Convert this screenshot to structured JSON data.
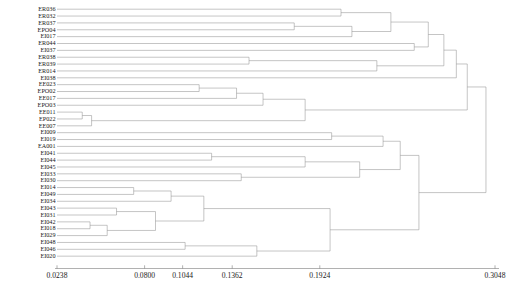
{
  "figure": {
    "type": "dendrogram",
    "orientation": "horizontal",
    "leaf_count": 36
  },
  "leaves": [
    {
      "label": "ER036"
    },
    {
      "label": "ER032"
    },
    {
      "label": "ER037"
    },
    {
      "label": "EPO04"
    },
    {
      "label": "EI017"
    },
    {
      "label": "ER044"
    },
    {
      "label": "EI037"
    },
    {
      "label": "ER038"
    },
    {
      "label": "ER039"
    },
    {
      "label": "ER014"
    },
    {
      "label": "EI038"
    },
    {
      "label": "EE023"
    },
    {
      "label": "EPO02"
    },
    {
      "label": "EE017"
    },
    {
      "label": "EPO03"
    },
    {
      "label": "EE011"
    },
    {
      "label": "EP022"
    },
    {
      "label": "EE007"
    },
    {
      "label": "EI009"
    },
    {
      "label": "EI019"
    },
    {
      "label": "EA001"
    },
    {
      "label": "EI041"
    },
    {
      "label": "EI044"
    },
    {
      "label": "EI045"
    },
    {
      "label": "EI033"
    },
    {
      "label": "EI030"
    },
    {
      "label": "EI014"
    },
    {
      "label": "EI049"
    },
    {
      "label": "EI034"
    },
    {
      "label": "EI043"
    },
    {
      "label": "EI031"
    },
    {
      "label": "EI042"
    },
    {
      "label": "EI018"
    },
    {
      "label": "EI029"
    },
    {
      "label": "EI048"
    },
    {
      "label": "EI046"
    },
    {
      "label": "EI020"
    }
  ],
  "axis": {
    "ticks": [
      {
        "value": 0.0238,
        "label": "0.0238"
      },
      {
        "value": 0.08,
        "label": "0.0800"
      },
      {
        "value": 0.1044,
        "label": "0.1044"
      },
      {
        "value": 0.1362,
        "label": "0.1362"
      },
      {
        "value": 0.1924,
        "label": "0.1924"
      },
      {
        "value": 0.3048,
        "label": "0.3048"
      }
    ],
    "min": 0.0238,
    "max": 0.3048
  },
  "chart_data": {
    "type": "dendrogram",
    "title": "",
    "xlabel": "",
    "ylabel": "",
    "xlim": [
      0.0238,
      0.3048
    ],
    "grid": false,
    "legend": "none",
    "leaf_order": [
      "ER036",
      "ER032",
      "ER037",
      "EPO04",
      "EI017",
      "ER044",
      "EI037",
      "ER038",
      "ER039",
      "ER014",
      "EI038",
      "EE023",
      "EPO02",
      "EE017",
      "EPO03",
      "EE011",
      "EP022",
      "EE007",
      "EI009",
      "EI019",
      "EA001",
      "EI041",
      "EI044",
      "EI045",
      "EI033",
      "EI030",
      "EI014",
      "EI049",
      "EI034",
      "EI043",
      "EI031",
      "EI042",
      "EI018",
      "EI029",
      "EI048",
      "EI046",
      "EI020"
    ],
    "merges": [
      {
        "id": "m1",
        "left": {
          "leaf": 11
        },
        "right": {
          "leaf": 12
        },
        "height": 0.115
      },
      {
        "id": "m2",
        "left": {
          "node": "m1"
        },
        "right": {
          "leaf": 13
        },
        "height": 0.139
      },
      {
        "id": "m3",
        "left": {
          "node": "m2"
        },
        "right": {
          "leaf": 14
        },
        "height": 0.156
      },
      {
        "id": "m4",
        "left": {
          "leaf": 15
        },
        "right": {
          "leaf": 16
        },
        "height": 0.04
      },
      {
        "id": "m5",
        "left": {
          "node": "m4"
        },
        "right": {
          "leaf": 17
        },
        "height": 0.046
      },
      {
        "id": "m6",
        "left": {
          "node": "m3"
        },
        "right": {
          "node": "m5"
        },
        "height": 0.183
      },
      {
        "id": "m7",
        "left": {
          "leaf": 0
        },
        "right": {
          "leaf": 1
        },
        "height": 0.206
      },
      {
        "id": "m8",
        "left": {
          "leaf": 2
        },
        "right": {
          "leaf": 3
        },
        "height": 0.176
      },
      {
        "id": "m9",
        "left": {
          "node": "m8"
        },
        "right": {
          "leaf": 4
        },
        "height": 0.213
      },
      {
        "id": "m10",
        "left": {
          "node": "m7"
        },
        "right": {
          "node": "m9"
        },
        "height": 0.238
      },
      {
        "id": "m11",
        "left": {
          "leaf": 5
        },
        "right": {
          "leaf": 6
        },
        "height": 0.253
      },
      {
        "id": "m12",
        "left": {
          "node": "m10"
        },
        "right": {
          "node": "m11"
        },
        "height": 0.262
      },
      {
        "id": "m13",
        "left": {
          "leaf": 7
        },
        "right": {
          "leaf": 8
        },
        "height": 0.147
      },
      {
        "id": "m14",
        "left": {
          "node": "m13"
        },
        "right": {
          "leaf": 9
        },
        "height": 0.229
      },
      {
        "id": "m15",
        "left": {
          "node": "m12"
        },
        "right": {
          "node": "m14"
        },
        "height": 0.272
      },
      {
        "id": "m16",
        "left": {
          "node": "m15"
        },
        "right": {
          "leaf": 10
        },
        "height": 0.28
      },
      {
        "id": "m17",
        "left": {
          "node": "m16"
        },
        "right": {
          "node": "m6"
        },
        "height": 0.287
      },
      {
        "id": "m18",
        "left": {
          "leaf": 18
        },
        "right": {
          "leaf": 19
        },
        "height": 0.2
      },
      {
        "id": "m19",
        "left": {
          "node": "m18"
        },
        "right": {
          "leaf": 20
        },
        "height": 0.233
      },
      {
        "id": "m20",
        "left": {
          "leaf": 21
        },
        "right": {
          "leaf": 22
        },
        "height": 0.123
      },
      {
        "id": "m21",
        "left": {
          "node": "m20"
        },
        "right": {
          "leaf": 23
        },
        "height": 0.183
      },
      {
        "id": "m22",
        "left": {
          "leaf": 24
        },
        "right": {
          "leaf": 25
        },
        "height": 0.142
      },
      {
        "id": "m23",
        "left": {
          "node": "m21"
        },
        "right": {
          "node": "m22"
        },
        "height": 0.218
      },
      {
        "id": "m24",
        "left": {
          "node": "m19"
        },
        "right": {
          "node": "m23"
        },
        "height": 0.244
      },
      {
        "id": "m25",
        "left": {
          "leaf": 26
        },
        "right": {
          "leaf": 27
        },
        "height": 0.073
      },
      {
        "id": "m26",
        "left": {
          "node": "m25"
        },
        "right": {
          "leaf": 28
        },
        "height": 0.097
      },
      {
        "id": "m27",
        "left": {
          "leaf": 29
        },
        "right": {
          "leaf": 30
        },
        "height": 0.062
      },
      {
        "id": "m28",
        "left": {
          "leaf": 31
        },
        "right": {
          "leaf": 32
        },
        "height": 0.045
      },
      {
        "id": "m29",
        "left": {
          "node": "m28"
        },
        "right": {
          "leaf": 33
        },
        "height": 0.056
      },
      {
        "id": "m30",
        "left": {
          "node": "m27"
        },
        "right": {
          "node": "m29"
        },
        "height": 0.087
      },
      {
        "id": "m31",
        "left": {
          "node": "m26"
        },
        "right": {
          "node": "m30"
        },
        "height": 0.118
      },
      {
        "id": "m32",
        "left": {
          "leaf": 34
        },
        "right": {
          "leaf": 35
        },
        "height": 0.106
      },
      {
        "id": "m33",
        "left": {
          "node": "m32"
        },
        "right": {
          "leaf": 36
        },
        "height": 0.152
      },
      {
        "id": "m34",
        "left": {
          "node": "m31"
        },
        "right": {
          "node": "m33"
        },
        "height": 0.199
      },
      {
        "id": "m35",
        "left": {
          "node": "m24"
        },
        "right": {
          "node": "m34"
        },
        "height": 0.256
      },
      {
        "id": "m36",
        "left": {
          "node": "m17"
        },
        "right": {
          "node": "m35"
        },
        "height": 0.299
      }
    ]
  },
  "caption": {
    "text": ""
  }
}
